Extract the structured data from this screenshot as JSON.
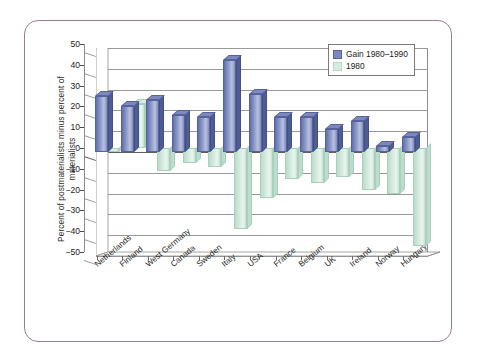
{
  "figure": {
    "border_color": "#9c7e93",
    "background": "#ffffff"
  },
  "chart_data": {
    "type": "bar",
    "title": "",
    "subtitle": "",
    "xlabel": "",
    "ylabel": "Percent of postmaterialists minus percent of materialists",
    "ylim": [
      -50,
      50
    ],
    "ytick_values": [
      50,
      40,
      30,
      20,
      10,
      0,
      -10,
      -20,
      -30,
      -40,
      -50
    ],
    "ytick_labels": [
      "50",
      "40",
      "30",
      "20",
      "10",
      "0",
      "−10",
      "−20",
      "−30",
      "−40",
      "−50"
    ],
    "grid": true,
    "grid_axis": "y",
    "legend_position": "top-right",
    "three_d": true,
    "categories": [
      "Netherlands",
      "Finland",
      "West Germany",
      "Canada",
      "Sweden",
      "Italy",
      "USA",
      "France",
      "Belgium",
      "UK",
      "Ireland",
      "Norway",
      "Hungary"
    ],
    "series": [
      {
        "name": "Gain 1980–1990",
        "color": "#7c89bf",
        "values": [
          27,
          22,
          25,
          18,
          17,
          44,
          28,
          17,
          17,
          11,
          15,
          3,
          7
        ]
      },
      {
        "name": "1980",
        "color": "#d7ece1",
        "values": [
          -2,
          21,
          -11,
          -7,
          -9,
          -39,
          -24,
          -15,
          -17,
          -14,
          -20,
          -22,
          -47
        ]
      }
    ]
  },
  "legend": {
    "entries": [
      {
        "label": "Gain 1980–1990",
        "swatch": "blue"
      },
      {
        "label": "1980",
        "swatch": "green"
      }
    ]
  }
}
